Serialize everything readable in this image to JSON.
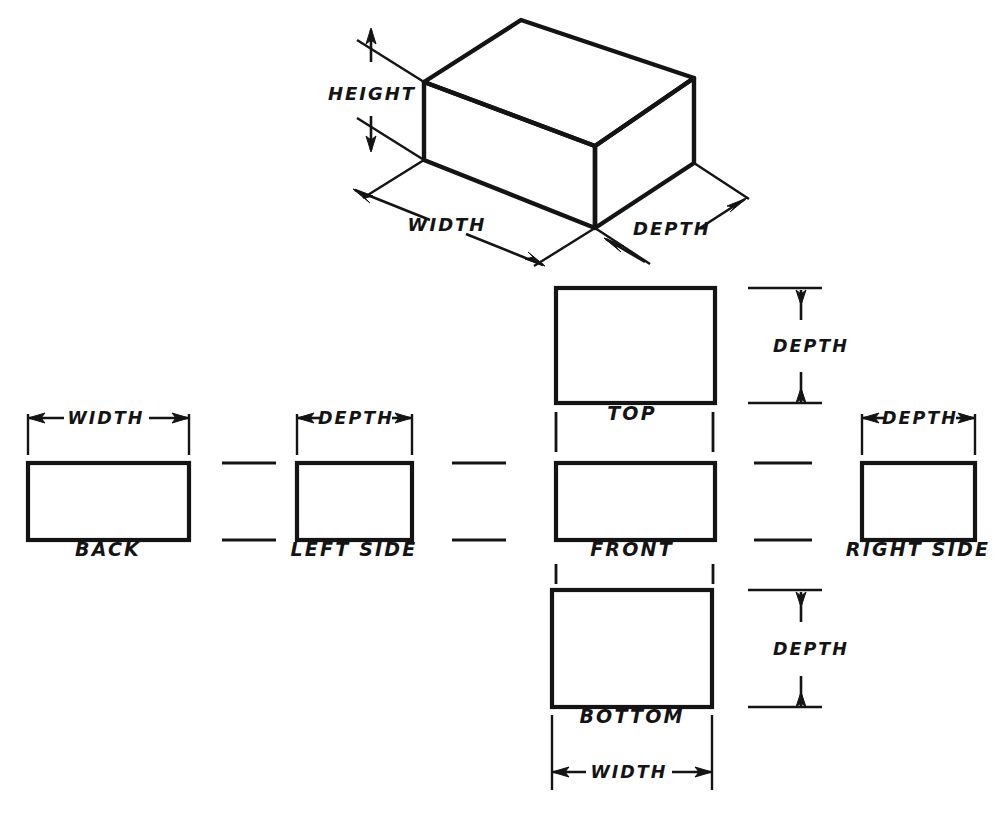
{
  "drawing": {
    "title": "Six Principal Orthographic Views Of A Rectangular Box",
    "stroke_color": "#141414",
    "background_color": "#ffffff",
    "pictorial": {
      "name": "isometric-box",
      "dimensions": [
        {
          "key": "height",
          "label": "HEIGHT"
        },
        {
          "key": "width",
          "label": "WIDTH"
        },
        {
          "key": "depth",
          "label": "DEPTH"
        }
      ]
    },
    "views": [
      {
        "key": "back",
        "label": "BACK",
        "dimension_label": "WIDTH",
        "dimension_axis": "horizontal"
      },
      {
        "key": "left_side",
        "label": "LEFT SIDE",
        "dimension_label": "DEPTH",
        "dimension_axis": "horizontal"
      },
      {
        "key": "top",
        "label": "TOP",
        "dimension_label": "DEPTH",
        "dimension_axis": "vertical"
      },
      {
        "key": "front",
        "label": "FRONT",
        "dimension_label": "",
        "dimension_axis": "none"
      },
      {
        "key": "bottom",
        "label": "BOTTOM",
        "dimension_label": "DEPTH",
        "dimension_axis": "vertical"
      },
      {
        "key": "right_side",
        "label": "RIGHT SIDE",
        "dimension_label": "DEPTH",
        "dimension_axis": "horizontal"
      }
    ],
    "labels": {
      "iso_height": "HEIGHT",
      "iso_width": "WIDTH",
      "iso_depth": "DEPTH",
      "back": "BACK",
      "back_dim": "WIDTH",
      "left_side": "LEFT SIDE",
      "left_side_dim": "DEPTH",
      "top": "TOP",
      "top_dim": "DEPTH",
      "front": "FRONT",
      "bottom": "BOTTOM",
      "bottom_dim": "DEPTH",
      "bottom_width_dim": "WIDTH",
      "right_side": "RIGHT SIDE",
      "right_side_dim": "DEPTH"
    }
  }
}
